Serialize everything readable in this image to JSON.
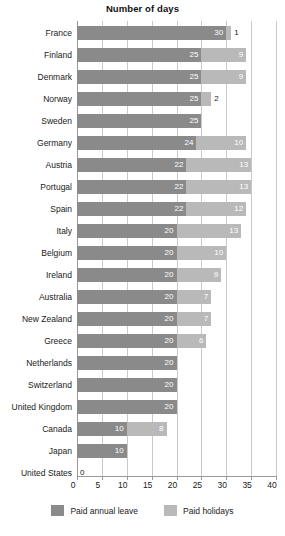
{
  "chart_data": {
    "type": "bar",
    "orientation": "horizontal",
    "stacked": true,
    "title": "Number of days",
    "xlabel": "",
    "ylabel": "",
    "xlim": [
      0,
      40
    ],
    "xticks": [
      0,
      5,
      10,
      15,
      20,
      25,
      30,
      35,
      40
    ],
    "grid": true,
    "legend_position": "bottom",
    "categories": [
      "France",
      "Finland",
      "Denmark",
      "Norway",
      "Sweden",
      "Germany",
      "Austria",
      "Portugal",
      "Spain",
      "Italy",
      "Belgium",
      "Ireland",
      "Australia",
      "New Zealand",
      "Greece",
      "Netherlands",
      "Switzerland",
      "United Kingdom",
      "Canada",
      "Japan",
      "United States"
    ],
    "series": [
      {
        "name": "Paid annual leave",
        "color": "#8a8a8a",
        "values": [
          30,
          25,
          25,
          25,
          25,
          24,
          22,
          22,
          22,
          20,
          20,
          20,
          20,
          20,
          20,
          20,
          20,
          20,
          10,
          10,
          0
        ]
      },
      {
        "name": "Paid holidays",
        "color": "#b9b9b9",
        "values": [
          1,
          9,
          9,
          2,
          0,
          10,
          13,
          13,
          12,
          13,
          10,
          9,
          7,
          7,
          6,
          0,
          0,
          0,
          8,
          0,
          0
        ]
      }
    ],
    "totals": [
      31,
      34,
      34,
      27,
      25,
      34,
      35,
      35,
      34,
      33,
      30,
      29,
      27,
      27,
      26,
      20,
      20,
      20,
      18,
      10,
      0
    ]
  },
  "legend": {
    "items": [
      {
        "label": "Paid annual leave",
        "swatch": "annual"
      },
      {
        "label": "Paid holidays",
        "swatch": "holiday"
      }
    ]
  },
  "colors": {
    "annual_leave": "#8a8a8a",
    "paid_holidays": "#b9b9b9",
    "gridline": "#c9c9c9",
    "axis": "#9a9a9a",
    "text": "#1a1a1a",
    "background": "#ffffff"
  }
}
